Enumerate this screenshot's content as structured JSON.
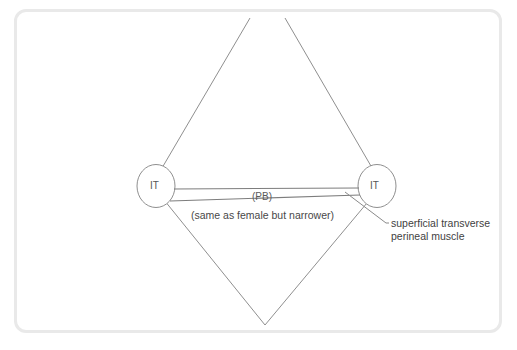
{
  "figure": {
    "frame": {
      "border_color": "#e9e9e9",
      "background": "#ffffff"
    },
    "stroke_color": "#8a8a8a",
    "text_color": "#484848",
    "labels": {
      "it_left": "IT",
      "it_right": "IT",
      "pb": "(PB)",
      "note": "(same as female but narrower)",
      "muscle_line1": "superficial transverse",
      "muscle_line2": "perineal muscle",
      "muscle_full": "superficial transverse perineal muscle"
    },
    "shapes": {
      "diamond": {
        "name": "perineum-diamond",
        "apex_top_left": [
          250,
          18
        ],
        "apex_top_right": [
          285,
          18
        ],
        "vertex_left": [
          152,
          185
        ],
        "vertex_right": [
          382,
          185
        ],
        "vertex_bottom": [
          265,
          325
        ],
        "apex_gap": true
      },
      "ischial_tuberosity_left": {
        "name": "ellipse-it-left",
        "cx": 156,
        "cy": 186,
        "rx": 19,
        "ry": 21.5
      },
      "ischial_tuberosity_right": {
        "name": "ellipse-it-right",
        "cx": 377,
        "cy": 186,
        "rx": 19,
        "ry": 21.5
      },
      "muscle_band_upper": {
        "name": "transverse-band-upper",
        "from": [
          174,
          189
        ],
        "to": [
          359,
          188
        ]
      },
      "muscle_band_lower": {
        "name": "transverse-band-lower",
        "from": [
          170,
          201
        ],
        "to": [
          360,
          195
        ]
      },
      "leader_line": {
        "name": "muscle-leader-line",
        "points": [
          [
            345,
            192
          ],
          [
            386,
            223
          ],
          [
            389,
            223
          ]
        ]
      }
    }
  }
}
